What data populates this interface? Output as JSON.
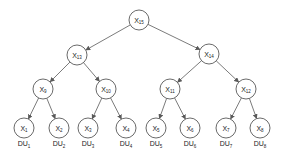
{
  "diagram": {
    "type": "binary-tree",
    "edge_color": "#595959",
    "node_radius": 10,
    "nodes": [
      {
        "id": "X15",
        "base": "X",
        "sub": "15",
        "x": 139,
        "y": 20
      },
      {
        "id": "X13",
        "base": "X",
        "sub": "13",
        "x": 77,
        "y": 55
      },
      {
        "id": "X14",
        "base": "X",
        "sub": "14",
        "x": 209,
        "y": 54
      },
      {
        "id": "X9",
        "base": "X",
        "sub": "9",
        "x": 43,
        "y": 89
      },
      {
        "id": "X10",
        "base": "X",
        "sub": "10",
        "x": 106,
        "y": 89
      },
      {
        "id": "X11",
        "base": "X",
        "sub": "11",
        "x": 170,
        "y": 89
      },
      {
        "id": "X12",
        "base": "X",
        "sub": "12",
        "x": 246,
        "y": 89
      },
      {
        "id": "X1",
        "base": "X",
        "sub": "1",
        "x": 24,
        "y": 128
      },
      {
        "id": "X2",
        "base": "X",
        "sub": "2",
        "x": 59,
        "y": 128
      },
      {
        "id": "X3",
        "base": "X",
        "sub": "3",
        "x": 88,
        "y": 128
      },
      {
        "id": "X4",
        "base": "X",
        "sub": "4",
        "x": 126,
        "y": 128
      },
      {
        "id": "X5",
        "base": "X",
        "sub": "5",
        "x": 156,
        "y": 128
      },
      {
        "id": "X6",
        "base": "X",
        "sub": "6",
        "x": 190,
        "y": 128
      },
      {
        "id": "X7",
        "base": "X",
        "sub": "7",
        "x": 226,
        "y": 128
      },
      {
        "id": "X8",
        "base": "X",
        "sub": "8",
        "x": 260,
        "y": 128
      }
    ],
    "edges": [
      {
        "from": "X15",
        "to": "X13"
      },
      {
        "from": "X15",
        "to": "X14"
      },
      {
        "from": "X13",
        "to": "X9"
      },
      {
        "from": "X13",
        "to": "X10"
      },
      {
        "from": "X14",
        "to": "X11"
      },
      {
        "from": "X14",
        "to": "X12"
      },
      {
        "from": "X9",
        "to": "X1"
      },
      {
        "from": "X9",
        "to": "X2"
      },
      {
        "from": "X10",
        "to": "X3"
      },
      {
        "from": "X10",
        "to": "X4"
      },
      {
        "from": "X11",
        "to": "X5"
      },
      {
        "from": "X11",
        "to": "X6"
      },
      {
        "from": "X12",
        "to": "X7"
      },
      {
        "from": "X12",
        "to": "X8"
      }
    ],
    "leaf_labels": [
      {
        "base": "DU",
        "sub": "1",
        "x": 24,
        "y": 146
      },
      {
        "base": "DU",
        "sub": "2",
        "x": 59,
        "y": 146
      },
      {
        "base": "DU",
        "sub": "3",
        "x": 88,
        "y": 146
      },
      {
        "base": "DU",
        "sub": "4",
        "x": 126,
        "y": 146
      },
      {
        "base": "DU",
        "sub": "5",
        "x": 156,
        "y": 146
      },
      {
        "base": "DU",
        "sub": "6",
        "x": 190,
        "y": 146
      },
      {
        "base": "DU",
        "sub": "7",
        "x": 226,
        "y": 146
      },
      {
        "base": "DU",
        "sub": "8",
        "x": 260,
        "y": 146
      }
    ]
  }
}
